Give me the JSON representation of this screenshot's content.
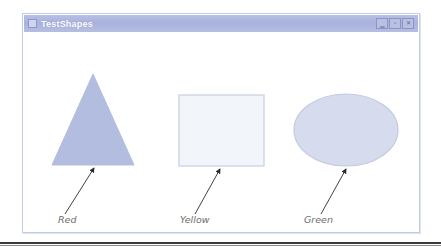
{
  "window": {
    "title": "TestShapes",
    "system_menu_icon": "system-menu-icon",
    "controls": [
      {
        "name": "minimize",
        "label": "_",
        "glyph": "▁"
      },
      {
        "name": "maximize",
        "label": "□",
        "glyph": "▫"
      },
      {
        "name": "close",
        "label": "X",
        "glyph": "✕"
      }
    ]
  },
  "canvas": {
    "shapes": [
      {
        "name": "triangle",
        "kind": "triangle",
        "fill": "#b3bddf",
        "stroke": "#b3bddf",
        "label": "Red"
      },
      {
        "name": "rectangle",
        "kind": "rectangle",
        "fill": "#f2f5fa",
        "stroke": "#c6d0e2",
        "label": "Yellow"
      },
      {
        "name": "ellipse",
        "kind": "ellipse",
        "fill": "#d6dcee",
        "stroke": "#c2cae1",
        "label": "Green"
      }
    ],
    "labels": {
      "red": "Red",
      "yellow": "Yellow",
      "green": "Green"
    },
    "annotation_arrow_color": "#2b2b2b"
  },
  "colors": {
    "titlebar_start": "#b8c0e4",
    "titlebar_end": "#b6bee2",
    "title_text": "#ffffff",
    "window_border": "#c3cbe6",
    "label_text": "#6d6d6d",
    "page_background": "#ffffff",
    "rule": "#3a3a3a"
  }
}
